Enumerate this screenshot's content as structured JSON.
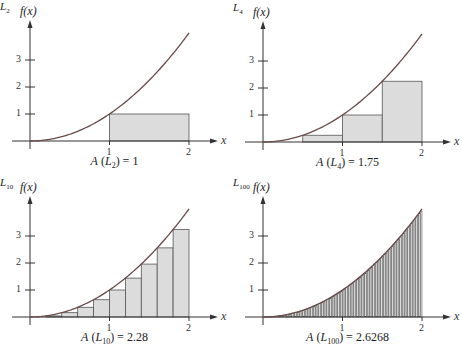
{
  "chart_data": [
    {
      "type": "bar",
      "title": "Left Riemann sum, n = 2",
      "function": "f(x) = x^2",
      "ylabel": "f(x)",
      "xlabel": "x",
      "x_ticks": [
        "1",
        "2"
      ],
      "y_ticks": [
        "1",
        "2",
        "3"
      ],
      "xlim": [
        0,
        2
      ],
      "ylim": [
        0,
        4
      ],
      "n": 2,
      "rect_label": "L",
      "rect_sub": "2",
      "caption_pre": "A (",
      "caption_L": "L",
      "caption_sub": "2",
      "caption_post": ") = 1",
      "area": 1
    },
    {
      "type": "bar",
      "title": "Left Riemann sum, n = 4",
      "function": "f(x) = x^2",
      "ylabel": "f(x)",
      "xlabel": "x",
      "x_ticks": [
        "1",
        "2"
      ],
      "y_ticks": [
        "1",
        "2",
        "3"
      ],
      "xlim": [
        0,
        2
      ],
      "ylim": [
        0,
        4
      ],
      "n": 4,
      "rect_label": "L",
      "rect_sub": "4",
      "caption_pre": "A (",
      "caption_L": "L",
      "caption_sub": "4",
      "caption_post": ") = 1.75",
      "area": 1.75
    },
    {
      "type": "bar",
      "title": "Left Riemann sum, n = 10",
      "function": "f(x) = x^2",
      "ylabel": "f(x)",
      "xlabel": "x",
      "x_ticks": [
        "1",
        "2"
      ],
      "y_ticks": [
        "1",
        "2",
        "3"
      ],
      "xlim": [
        0,
        2
      ],
      "ylim": [
        0,
        4
      ],
      "n": 10,
      "rect_label": "L",
      "rect_sub": "10",
      "caption_pre": "A (",
      "caption_L": "L",
      "caption_sub": "10",
      "caption_post": ") = 2.28",
      "area": 2.28
    },
    {
      "type": "bar",
      "title": "Left Riemann sum, n = 100",
      "function": "f(x) = x^2",
      "ylabel": "f(x)",
      "xlabel": "x",
      "x_ticks": [
        "1",
        "2"
      ],
      "y_ticks": [
        "1",
        "2",
        "3"
      ],
      "xlim": [
        0,
        2
      ],
      "ylim": [
        0,
        4
      ],
      "n": 100,
      "rect_label": "L",
      "rect_sub": "100",
      "caption_pre": "A (",
      "caption_L": "L",
      "caption_sub": "100",
      "caption_post": ") = 2.6268",
      "area": 2.6268
    }
  ],
  "style": {
    "fill": "#dcdcdc",
    "stroke": "#555555",
    "curve": "#6a4a4a",
    "axis": "#333333"
  }
}
